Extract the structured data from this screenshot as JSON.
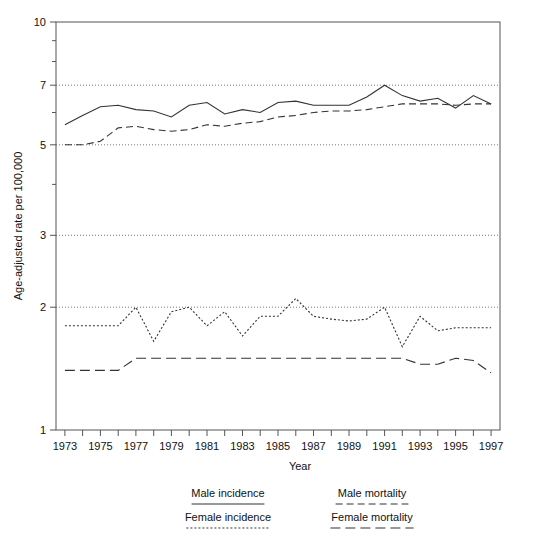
{
  "chart_data": {
    "type": "line",
    "title": "",
    "xlabel": "Year",
    "ylabel": "Age-adjusted rate per 100,000",
    "yscale": "log",
    "ylim": [
      1,
      10
    ],
    "xlim": [
      1972.5,
      1997.5
    ],
    "grid": "horizontal-dotted",
    "legend_position": "below-plot",
    "ytick_labels": [
      "1",
      "2",
      "3",
      "5",
      "7",
      "10"
    ],
    "ytick_values": [
      1,
      2,
      3,
      5,
      7,
      10
    ],
    "xtick_labels": [
      "1973",
      "1975",
      "1977",
      "1979",
      "1981",
      "1983",
      "1985",
      "1987",
      "1989",
      "1991",
      "1993",
      "1995",
      "1997"
    ],
    "xtick_values": [
      1973,
      1975,
      1977,
      1979,
      1981,
      1983,
      1985,
      1987,
      1989,
      1991,
      1993,
      1995,
      1997
    ],
    "x": [
      1973,
      1974,
      1975,
      1976,
      1977,
      1978,
      1979,
      1980,
      1981,
      1982,
      1983,
      1984,
      1985,
      1986,
      1987,
      1988,
      1989,
      1990,
      1991,
      1992,
      1993,
      1994,
      1995,
      1996,
      1997
    ],
    "series": [
      {
        "name": "Male incidence",
        "style": "solid",
        "color": "#333333",
        "values": [
          5.6,
          5.9,
          6.2,
          6.25,
          6.1,
          6.05,
          5.85,
          6.25,
          6.35,
          5.95,
          6.1,
          6.0,
          6.35,
          6.4,
          6.25,
          6.25,
          6.25,
          6.55,
          7.0,
          6.6,
          6.4,
          6.5,
          6.15,
          6.6,
          6.3
        ]
      },
      {
        "name": "Male mortality",
        "style": "dashed",
        "color": "#333333",
        "values": [
          5.0,
          5.0,
          5.1,
          5.5,
          5.55,
          5.45,
          5.4,
          5.45,
          5.6,
          5.55,
          5.65,
          5.7,
          5.85,
          5.9,
          6.0,
          6.05,
          6.05,
          6.1,
          6.2,
          6.3,
          6.3,
          6.3,
          6.25,
          6.3,
          6.3
        ]
      },
      {
        "name": "Female incidence",
        "style": "dotted",
        "color": "#333333",
        "values": [
          1.8,
          1.8,
          1.8,
          1.8,
          2.0,
          1.65,
          1.95,
          2.0,
          1.8,
          1.95,
          1.7,
          1.9,
          1.9,
          2.1,
          1.9,
          1.87,
          1.85,
          1.87,
          2.0,
          1.6,
          1.9,
          1.75,
          1.78,
          1.78,
          1.78
        ]
      },
      {
        "name": "Female mortality",
        "style": "longdash",
        "color": "#333333",
        "values": [
          1.4,
          1.4,
          1.4,
          1.4,
          1.5,
          1.5,
          1.5,
          1.5,
          1.5,
          1.5,
          1.5,
          1.5,
          1.5,
          1.5,
          1.5,
          1.5,
          1.5,
          1.5,
          1.5,
          1.5,
          1.45,
          1.45,
          1.5,
          1.48,
          1.38
        ]
      }
    ]
  },
  "legend": {
    "entries": [
      {
        "label": "Male incidence",
        "style": "solid"
      },
      {
        "label": "Male mortality",
        "style": "dashed"
      },
      {
        "label": "Female incidence",
        "style": "dotted"
      },
      {
        "label": "Female mortality",
        "style": "longdash"
      }
    ]
  }
}
